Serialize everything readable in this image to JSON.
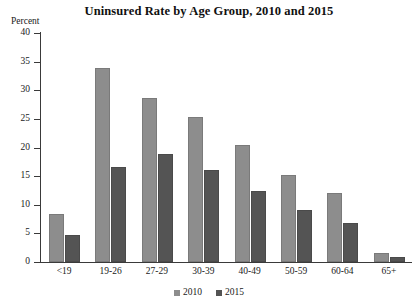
{
  "chart_data": {
    "type": "bar",
    "title": "Uninsured Rate by Age Group, 2010 and 2015",
    "xlabel": "",
    "ylabel": "Percent",
    "ylim": [
      0,
      40
    ],
    "ytick_step": 5,
    "grid": false,
    "legend_position": "bottom",
    "categories": [
      "<19",
      "19-26",
      "27-29",
      "30-39",
      "40-49",
      "50-59",
      "60-64",
      "65+"
    ],
    "ytick_labels": [
      "40",
      "35",
      "30",
      "25",
      "20",
      "15",
      "10",
      "5",
      "0"
    ],
    "series": [
      {
        "name": "2010",
        "color": "#8d8d8d",
        "values": [
          8.3,
          33.9,
          28.7,
          25.3,
          20.4,
          15.2,
          12.1,
          1.5
        ]
      },
      {
        "name": "2015",
        "color": "#545454",
        "values": [
          4.8,
          16.6,
          18.8,
          16.0,
          12.4,
          9.1,
          6.8,
          0.9
        ]
      }
    ]
  }
}
